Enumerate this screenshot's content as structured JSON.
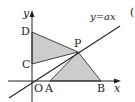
{
  "diagram": {
    "type": "coordinate-geometry",
    "axes": {
      "x_label": "x",
      "y_label": "y",
      "origin_label": "O"
    },
    "line": {
      "label": "y=ax"
    },
    "points": [
      {
        "name": "O",
        "label": "O"
      },
      {
        "name": "A",
        "label": "A"
      },
      {
        "name": "B",
        "label": "B"
      },
      {
        "name": "C",
        "label": "C"
      },
      {
        "name": "D",
        "label": "D"
      },
      {
        "name": "P",
        "label": "P"
      }
    ],
    "shaded_regions": [
      "triangle DCP",
      "triangle PAB"
    ],
    "colors": {
      "shade": "#cccccc",
      "stroke": "#222222"
    },
    "cut_off_mark": "("
  }
}
